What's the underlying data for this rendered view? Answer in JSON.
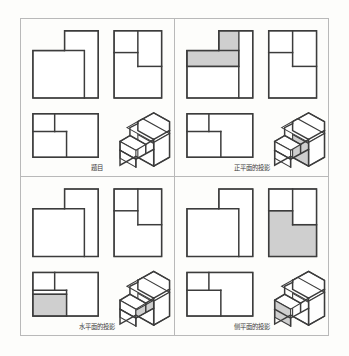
{
  "figure": {
    "background_color": "#fdfdfb",
    "border_color": "#b9b9b9",
    "line_color": "#3c3c3c",
    "shade_color": "#cfcfcf"
  },
  "panels": [
    {
      "id": "panel-problem",
      "caption": "题目",
      "highlight": "none",
      "views": [
        "front-view",
        "side-view",
        "top-view",
        "isometric-view"
      ]
    },
    {
      "id": "panel-frontal-plane",
      "caption": "正平面的投影",
      "highlight": "front-view",
      "views": [
        "front-view",
        "side-view",
        "top-view",
        "isometric-view"
      ]
    },
    {
      "id": "panel-horizontal-plane",
      "caption": "水平面的投影",
      "highlight": "top-view",
      "views": [
        "front-view",
        "side-view",
        "top-view",
        "isometric-view"
      ]
    },
    {
      "id": "panel-profile-plane",
      "caption": "侧平面的投影",
      "highlight": "side-view",
      "views": [
        "front-view",
        "side-view",
        "top-view",
        "isometric-view"
      ]
    }
  ],
  "geometry": {
    "front_view": {
      "label": "front-view",
      "outline_points": "8,30 8,78 70,78 70,8 40,8 40,30",
      "inner_line": "40,30 58,30 58,78",
      "shaded_region_points": "8,30 40,30 40,8 70,8 70,8 58,8 58,30 40,30 40,30 8,30"
    },
    "side_view": {
      "label": "side-view",
      "outline_points": "0,8 0,78 48,78 48,8",
      "inner_lines": [
        "0,30 26,30",
        "26,8 26,44",
        "26,44 48,44"
      ]
    },
    "top_view": {
      "label": "top-view",
      "outline_points": "8,0 8,40 70,40 70,0",
      "inner_lines": [
        "8,18 40,18",
        "28,0 28,18",
        "40,18 40,40"
      ]
    },
    "isometric_view": {
      "label": "isometric-view",
      "description": "L-shaped stepped block in isometric projection"
    }
  }
}
